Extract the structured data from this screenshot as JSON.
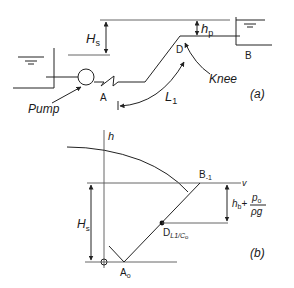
{
  "figure": {
    "panel_a": {
      "panel_label": "(a)",
      "labels": {
        "Hs_main": "H",
        "Hs_sub": "s",
        "hp_main": "h",
        "hp_sub": "p",
        "point_A": "A",
        "point_B": "B",
        "point_D": "D",
        "pump": "Pump",
        "knee": "Knee",
        "L1_main": "L",
        "L1_sub": "1"
      }
    },
    "panel_b": {
      "panel_label": "(b)",
      "labels": {
        "h_axis": "h",
        "v_axis": "v",
        "Hs_main": "H",
        "Hs_sub": "s",
        "point_A_main": "A",
        "point_A_sub": "o",
        "point_B_main": "B",
        "point_B_sub": "-1",
        "point_D_main": "D",
        "point_D_sub": "L1/C",
        "point_D_sub2": "o",
        "head_expr_main": "h",
        "head_expr_sub": "b",
        "head_expr_plus": "+",
        "frac_num_main": "p",
        "frac_num_sub": "o",
        "frac_den": "ρg"
      }
    }
  }
}
